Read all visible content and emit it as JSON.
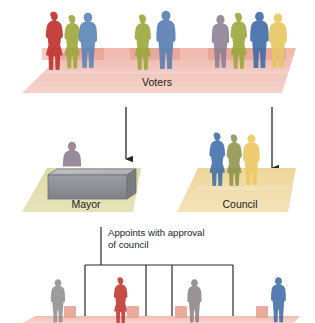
{
  "diagram": {
    "type": "organizational-flow",
    "background_color": "#ffffff"
  },
  "tiers": [
    {
      "id": "voters",
      "label": "Voters",
      "platform_color": "#f2c6bd",
      "platform_shadow_color": "#e9a89c",
      "figures": [
        {
          "color": "#c0342e",
          "group": "left"
        },
        {
          "color": "#9aa83a",
          "group": "left"
        },
        {
          "color": "#5a86b8",
          "group": "left"
        },
        {
          "color": "#9aa83a",
          "group": "center"
        },
        {
          "color": "#5b80b4",
          "group": "center"
        },
        {
          "color": "#8a7f93",
          "group": "right"
        },
        {
          "color": "#9aa83a",
          "group": "right"
        },
        {
          "color": "#3f6da8",
          "group": "right"
        },
        {
          "color": "#e8c862",
          "group": "right"
        }
      ]
    },
    {
      "id": "mayor",
      "label": "Mayor",
      "platform_color": "#ddd9a8",
      "desk_color": "#8f9296",
      "desk_top_color": "#b9bcc0",
      "figures": [
        {
          "color": "#8c7c8d"
        }
      ]
    },
    {
      "id": "council",
      "label": "Council",
      "platform_color": "#eed9a0",
      "figures": [
        {
          "color": "#3f6da8"
        },
        {
          "color": "#8a8f45"
        },
        {
          "color": "#edc964"
        }
      ]
    },
    {
      "id": "departments",
      "label": "",
      "platform_color": "#f2c6bd",
      "figures": [
        {
          "color": "#8d8b8b",
          "box_color": "#e8a193"
        },
        {
          "color": "#c0342e",
          "box_color": "#e8a193"
        },
        {
          "color": "#8a7f84",
          "box_color": "#e8a193"
        },
        {
          "color": "#3f6da8",
          "box_color": "#e8a193"
        }
      ]
    }
  ],
  "arrows": [
    {
      "id": "voters-to-mayor",
      "from": "voters",
      "to": "mayor",
      "color": "#26282b"
    },
    {
      "id": "voters-to-council",
      "from": "voters",
      "to": "council",
      "color": "#26282b"
    }
  ],
  "annotations": [
    {
      "id": "appoints-note",
      "line1": "Appoints with approval",
      "line2": "of council",
      "color": "#16232b"
    }
  ],
  "bracket": {
    "id": "appointment-bracket",
    "color": "#26282b",
    "branch_count": 4
  },
  "colors": {
    "ink": "#1c1c1c",
    "line": "#26282b",
    "voters_platform": "#f2c6bd",
    "mayor_platform": "#ddd9a8",
    "council_platform": "#eed9a0"
  }
}
